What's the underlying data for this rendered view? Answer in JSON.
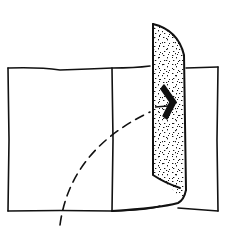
{
  "diagram": {
    "colors": {
      "ink": "#111111",
      "background": "#ffffff",
      "stipple": "#1a1a1a"
    },
    "elements": [
      {
        "id": "outer-rectangle",
        "type": "rectangle"
      },
      {
        "id": "divider-line",
        "type": "line"
      },
      {
        "id": "folded-flap",
        "type": "stippled-shape"
      },
      {
        "id": "swing-arc",
        "type": "dashed-curve"
      },
      {
        "id": "direction-arrow",
        "type": "arrow",
        "direction": "right"
      }
    ]
  }
}
